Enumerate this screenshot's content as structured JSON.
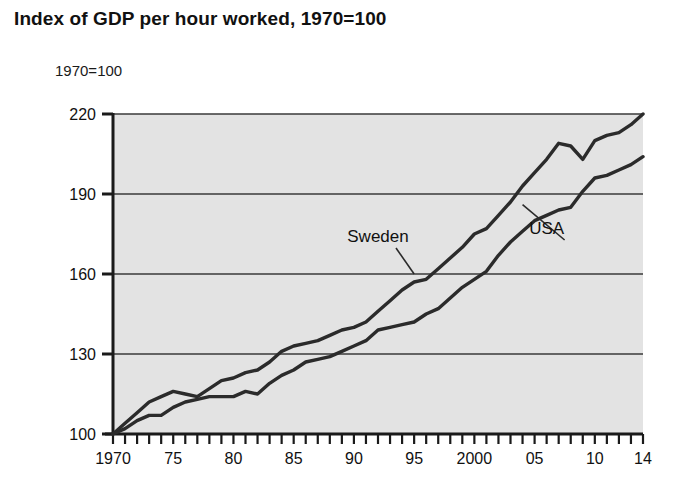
{
  "title": "Index of GDP per hour worked, 1970=100",
  "axis_caption": "1970=100",
  "colors": {
    "plot_background": "#e3e3e3",
    "line": "#2b2b2b",
    "gridline": "#3a3a3a",
    "axis": "#1a1a1a",
    "text": "#111111",
    "page_background": "#ffffff"
  },
  "series_labels": [
    {
      "name": "Sweden",
      "text": "Sweden"
    },
    {
      "name": "USA",
      "text": "USA"
    }
  ],
  "chart_data": {
    "type": "line",
    "title": "Index of GDP per hour worked, 1970=100",
    "subtitle": "",
    "xlabel": "",
    "ylabel": "1970=100",
    "xlim": [
      1970,
      2014
    ],
    "ylim": [
      100,
      220
    ],
    "yticks": [
      100,
      130,
      160,
      190,
      220
    ],
    "ytick_labels": [
      "100",
      "130",
      "160",
      "190",
      "220"
    ],
    "xticks": [
      1970,
      1975,
      1980,
      1985,
      1990,
      1995,
      2000,
      2005,
      2014
    ],
    "xtick_labels": [
      "1970",
      "75",
      "80",
      "85",
      "90",
      "95",
      "2000",
      "05",
      "10",
      "14"
    ],
    "xtick_label_years": [
      1970,
      1975,
      1980,
      1985,
      1990,
      1995,
      2000,
      2005,
      2010,
      2014
    ],
    "minor_ticks": "every year",
    "grid": "horizontal only",
    "legend": "inline annotations with leader lines",
    "x": [
      1970,
      1971,
      1972,
      1973,
      1974,
      1975,
      1976,
      1977,
      1978,
      1979,
      1980,
      1981,
      1982,
      1983,
      1984,
      1985,
      1986,
      1987,
      1988,
      1989,
      1990,
      1991,
      1992,
      1993,
      1994,
      1995,
      1996,
      1997,
      1998,
      1999,
      2000,
      2001,
      2002,
      2003,
      2004,
      2005,
      2006,
      2007,
      2008,
      2009,
      2010,
      2011,
      2012,
      2013,
      2014
    ],
    "series": [
      {
        "name": "Sweden",
        "values": [
          100,
          104,
          108,
          112,
          114,
          116,
          115,
          114,
          117,
          120,
          121,
          123,
          124,
          127,
          131,
          133,
          134,
          135,
          137,
          139,
          140,
          142,
          146,
          150,
          154,
          157,
          158,
          162,
          166,
          170,
          175,
          177,
          182,
          187,
          193,
          198,
          203,
          209,
          208,
          203,
          210,
          212,
          213,
          216,
          220
        ],
        "label_position": {
          "x": 1992,
          "y": 172
        },
        "leader_to": {
          "x": 1995,
          "y": 160
        }
      },
      {
        "name": "USA",
        "values": [
          100,
          102,
          105,
          107,
          107,
          110,
          112,
          113,
          114,
          114,
          114,
          116,
          115,
          119,
          122,
          124,
          127,
          128,
          129,
          131,
          133,
          135,
          139,
          140,
          141,
          142,
          145,
          147,
          151,
          155,
          158,
          161,
          167,
          172,
          176,
          180,
          182,
          184,
          185,
          191,
          196,
          197,
          199,
          201,
          204
        ],
        "label_position": {
          "x": 2006,
          "y": 175
        },
        "leader_to": {
          "x": 2004,
          "y": 186
        }
      }
    ]
  }
}
